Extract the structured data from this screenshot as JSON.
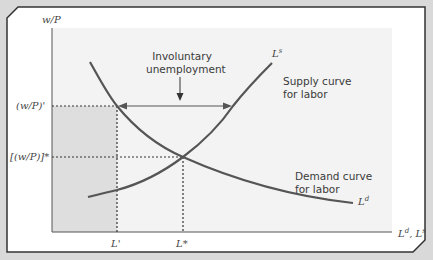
{
  "figure": {
    "type": "labor-market-diagram",
    "y_axis_label": "w/P",
    "x_axis_label": "L^d, L^s",
    "y_ticks": [
      "(w/P)'",
      "[(w/P)]*"
    ],
    "x_ticks": [
      "L'",
      "L*"
    ],
    "curves": [
      {
        "name": "Supply curve for labor",
        "symbol": "L^s",
        "label_line1": "Supply curve",
        "label_line2": "for labor"
      },
      {
        "name": "Demand curve for labor",
        "symbol": "L^d",
        "label_line1": "Demand curve",
        "label_line2": "for labor"
      }
    ],
    "annotation": {
      "line1": "Involuntary",
      "line2": "unemployment"
    },
    "colors": {
      "background": "#d9d9d9",
      "panel": "#ffffff",
      "plot_area": "#f2f2f2",
      "shaded_region": "#dcdcdc",
      "curve": "#555555",
      "border": "#333333"
    }
  },
  "labels": {
    "y_axis": "w/P",
    "x_axis_base1": "L",
    "x_axis_sup1": "d",
    "x_axis_sep": ", ",
    "x_axis_base2": "L",
    "x_axis_sup2": "s",
    "wp_prime": "(w/P)'",
    "wp_star": "[(w/P)]*",
    "l_prime": "L'",
    "l_star": "L*",
    "ls_base": "L",
    "ls_sup": "s",
    "ld_base": "L",
    "ld_sup": "d",
    "supply_line1": "Supply curve",
    "supply_line2": "for labor",
    "demand_line1": "Demand curve",
    "demand_line2": "for labor",
    "invol_line1": "Involuntary",
    "invol_line2": "unemployment"
  }
}
